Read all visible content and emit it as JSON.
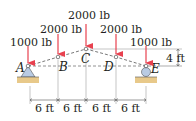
{
  "figure": {
    "type": "truss-diagram",
    "colors": {
      "load_arrow": "#e8414f",
      "member_line": "#555555",
      "ground": "#e8c98a",
      "support_fill": "#b9cbe3",
      "text": "#231f20"
    },
    "nodes": [
      {
        "id": "A",
        "label": "A"
      },
      {
        "id": "B",
        "label": "B"
      },
      {
        "id": "C",
        "label": "C"
      },
      {
        "id": "D",
        "label": "D"
      },
      {
        "id": "E",
        "label": "E"
      }
    ],
    "loads": [
      {
        "node": "A",
        "label": "1000 lb"
      },
      {
        "node": "B",
        "label": "2000 lb"
      },
      {
        "node": "C",
        "label": "2000 lb"
      },
      {
        "node": "D",
        "label": "2000 lb"
      },
      {
        "node": "E",
        "label": "1000 lb"
      }
    ],
    "supports": [
      {
        "node": "A",
        "type": "pin"
      },
      {
        "node": "E",
        "type": "roller"
      }
    ],
    "dimensions": {
      "horizontal": [
        "6 ft",
        "6 ft",
        "6 ft",
        "6 ft"
      ],
      "vertical": "4 ft"
    }
  }
}
